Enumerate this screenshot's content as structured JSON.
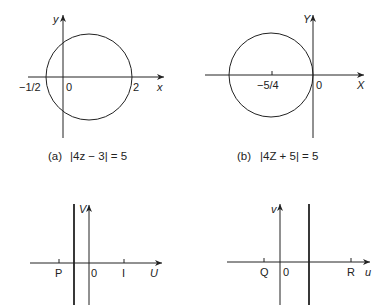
{
  "panels": [
    {
      "id": "a",
      "caption_tag": "(a)",
      "caption_eq": "|4z − 3| = 5",
      "axis_x_label": "x",
      "axis_y_label": "y",
      "origin_label": "0",
      "ticks": [
        {
          "label": "−1/2",
          "value": -0.5
        },
        {
          "label": "2",
          "value": 2
        }
      ],
      "shape": {
        "type": "circle",
        "center": [
          0.75,
          0
        ],
        "radius": 1.25
      }
    },
    {
      "id": "b",
      "caption_tag": "(b)",
      "caption_eq": "|4Z + 5| = 5",
      "axis_x_label": "X",
      "axis_y_label": "Y",
      "origin_label": "0",
      "ticks": [
        {
          "label": "−5/4",
          "value": -1.25
        }
      ],
      "shape": {
        "type": "circle",
        "center": [
          -1.25,
          0
        ],
        "radius": 1.25
      }
    },
    {
      "id": "c",
      "axis_x_label": "U",
      "axis_y_label": "V",
      "origin_label": "0",
      "ticks": [
        {
          "label": "P"
        },
        {
          "label": "I"
        }
      ],
      "shape": {
        "type": "vertical-line",
        "position": "between P and 0"
      }
    },
    {
      "id": "d",
      "axis_x_label": "u",
      "axis_y_label": "v",
      "origin_label": "0",
      "ticks": [
        {
          "label": "Q"
        },
        {
          "label": "R"
        }
      ],
      "shape": {
        "type": "vertical-line",
        "position": "between 0 and R"
      }
    }
  ],
  "colors": {
    "ink": "#222222",
    "background": "#ffffff"
  }
}
